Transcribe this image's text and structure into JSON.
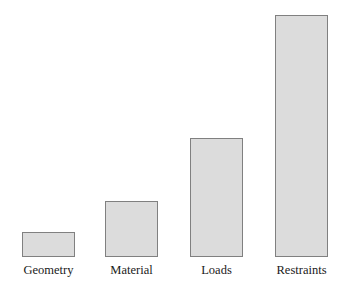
{
  "chart_data": {
    "type": "bar",
    "title": "",
    "subtitle": "",
    "xlabel": "",
    "ylabel": "",
    "categories": [
      "Geometry",
      "Material",
      "Loads",
      "Restraints"
    ],
    "values": [
      10,
      23,
      49,
      100
    ],
    "ylim": [
      0,
      100
    ],
    "grid": false,
    "legend": false,
    "legend_position": "none",
    "axis_visible": false,
    "tick_labels_y": [],
    "annotations": [],
    "series": [
      {
        "name": "Relative effort",
        "values": [
          10,
          23,
          49,
          100
        ]
      }
    ],
    "bar_fill_color": "#dcdcdc",
    "bar_border_color": "#808080",
    "background_color": "#ffffff",
    "label_color": "#1a1a1a"
  },
  "bars": [
    {
      "label": "Geometry",
      "value": 10,
      "left_px": 22,
      "width_px": 53,
      "height_px": 25
    },
    {
      "label": "Material",
      "value": 23,
      "left_px": 105,
      "width_px": 53,
      "height_px": 56
    },
    {
      "label": "Loads",
      "value": 49,
      "left_px": 190,
      "width_px": 53,
      "height_px": 119
    },
    {
      "label": "Restraints",
      "value": 100,
      "left_px": 275,
      "width_px": 53,
      "height_px": 242
    }
  ]
}
